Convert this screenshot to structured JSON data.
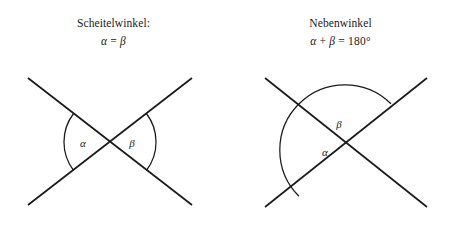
{
  "page": {
    "background_color": "#ffffff",
    "ink_color": "#1a1a1a",
    "width": 454,
    "height": 227
  },
  "figures": [
    {
      "id": "scheitelwinkel",
      "title": "Scheitelwinkel:",
      "formula": {
        "full": "α = β",
        "left_symbol": "α",
        "operator": "=",
        "right_symbol": "β"
      },
      "description": "Two straight lines crossing in an X; the opposite (vertical) angles on the left and right of the intersection are marked.",
      "intersection": {
        "x": 110,
        "y": 142
      },
      "lines": [
        {
          "name": "line-descending",
          "x1": 28,
          "y1": 78,
          "x2": 192,
          "y2": 205
        },
        {
          "name": "line-ascending",
          "x1": 28,
          "y1": 205,
          "x2": 192,
          "y2": 78
        }
      ],
      "angle_marks": [
        {
          "label": "α",
          "position": "west",
          "label_x": 83,
          "label_y": 147,
          "radius": 47
        },
        {
          "label": "β",
          "position": "east",
          "label_x": 131,
          "label_y": 147,
          "radius": 47
        }
      ]
    },
    {
      "id": "nebenwinkel",
      "title": "Nebenwinkel",
      "formula": {
        "full": "α + β = 180°",
        "left_symbol": "α",
        "operator_add": "+",
        "right_symbol": "β",
        "operator_eq": "=",
        "value": "180",
        "unit": "°"
      },
      "description": "Two straight lines crossing in an X; one large arc sweeps from the lower-left ray over the top to the upper-right ray, divided by the descending line into a lower wedge (alpha) and an upper wedge (beta).",
      "intersection": {
        "x": 118,
        "y": 150
      },
      "lines": [
        {
          "name": "line-descending",
          "x1": 38,
          "y1": 78,
          "x2": 200,
          "y2": 207
        },
        {
          "name": "line-ascending",
          "x1": 38,
          "y1": 207,
          "x2": 200,
          "y2": 78
        }
      ],
      "angle_marks": [
        {
          "label": "α",
          "position": "lower-left-wedge",
          "label_x": 98,
          "label_y": 152,
          "radius": 58
        },
        {
          "label": "β",
          "position": "upper-wedge",
          "label_x": 110,
          "label_y": 125,
          "radius": 58
        }
      ]
    }
  ]
}
